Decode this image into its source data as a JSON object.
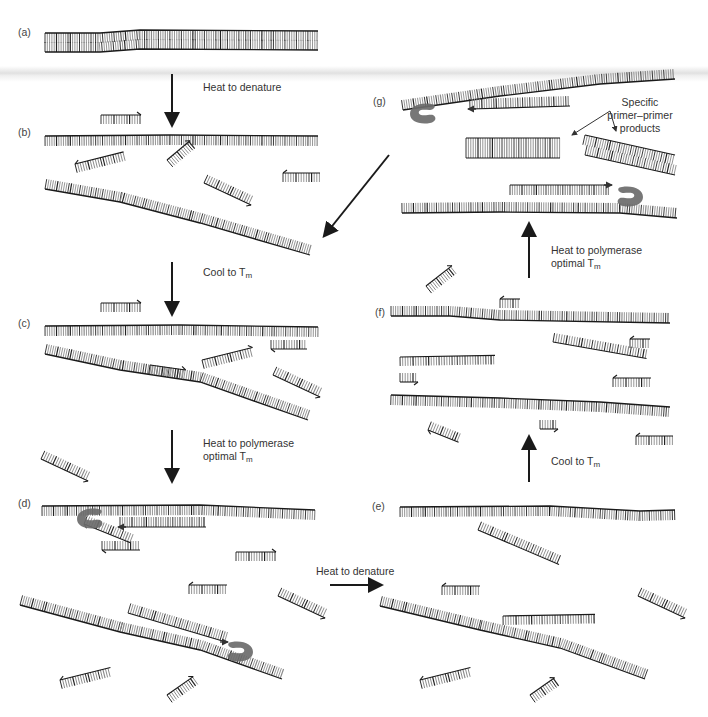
{
  "figure": {
    "colors": {
      "strand": "#1a1a1a",
      "tick_dark": "#222222",
      "tick_light": "#8a8a8a",
      "polymerase": "#6b6b6b",
      "text": "#333333",
      "background": "#ffffff"
    }
  },
  "panels": [
    {
      "id": "a",
      "label": "(a)",
      "x": 18,
      "y": 26
    },
    {
      "id": "b",
      "label": "(b)",
      "x": 18,
      "y": 126
    },
    {
      "id": "c",
      "label": "(c)",
      "x": 18,
      "y": 317
    },
    {
      "id": "d",
      "label": "(d)",
      "x": 18,
      "y": 497
    },
    {
      "id": "e",
      "label": "(e)",
      "x": 372,
      "y": 500
    },
    {
      "id": "f",
      "label": "(f)",
      "x": 375,
      "y": 306
    },
    {
      "id": "g",
      "label": "(g)",
      "x": 373,
      "y": 95
    }
  ],
  "steps": [
    {
      "id": "a-to-b",
      "text": "Heat to denature",
      "sub": "",
      "x": 203,
      "y": 81
    },
    {
      "id": "b-to-c",
      "text": "Cool to T",
      "sub": "m",
      "x": 203,
      "y": 266
    },
    {
      "id": "c-to-d",
      "text": "Heat to polymerase",
      "text2": "optimal T",
      "sub": "m",
      "x": 203,
      "y": 437
    },
    {
      "id": "d-to-e",
      "text": "Heat to denature",
      "sub": "",
      "x": 316,
      "y": 565
    },
    {
      "id": "e-to-f",
      "text": "Cool to T",
      "sub": "m",
      "x": 551,
      "y": 455
    },
    {
      "id": "f-to-g",
      "text": "Heat to polymerase",
      "text2": "optimal T",
      "sub": "m",
      "x": 551,
      "y": 244
    }
  ],
  "annotations": [
    {
      "id": "specific-products",
      "lines": [
        "Specific",
        "primer–primer",
        "products"
      ],
      "x": 628,
      "y": 96
    }
  ],
  "arrows": [
    {
      "id": "arrow-a-b",
      "x1": 172,
      "y1": 74,
      "x2": 172,
      "y2": 124,
      "dir": "down"
    },
    {
      "id": "arrow-b-c",
      "x1": 172,
      "y1": 262,
      "x2": 172,
      "y2": 313,
      "dir": "down"
    },
    {
      "id": "arrow-c-d",
      "x1": 172,
      "y1": 430,
      "x2": 172,
      "y2": 480,
      "dir": "down"
    },
    {
      "id": "arrow-d-e",
      "x1": 330,
      "y1": 585,
      "x2": 380,
      "y2": 585,
      "dir": "right"
    },
    {
      "id": "arrow-e-f",
      "x1": 529,
      "y1": 482,
      "x2": 529,
      "y2": 438,
      "dir": "up"
    },
    {
      "id": "arrow-f-g",
      "x1": 529,
      "y1": 278,
      "x2": 529,
      "y2": 225,
      "dir": "up"
    },
    {
      "id": "arrow-g-b",
      "x1": 389,
      "y1": 155,
      "x2": 325,
      "y2": 235,
      "dir": "diag"
    },
    {
      "id": "arrow-specific-1",
      "x1": 610,
      "y1": 111,
      "x2": 572,
      "y2": 135,
      "dir": "thin"
    },
    {
      "id": "arrow-specific-2",
      "x1": 610,
      "y1": 111,
      "x2": 616,
      "y2": 131,
      "dir": "thin"
    }
  ],
  "strands": [
    {
      "panel": "a",
      "pts": [
        [
          45,
          33
        ],
        [
          100,
          33
        ],
        [
          140,
          30
        ],
        [
          318,
          31
        ]
      ],
      "side": "down",
      "len": 10,
      "double": true
    },
    {
      "panel": "a",
      "pts": [
        [
          45,
          52
        ],
        [
          100,
          52
        ],
        [
          140,
          49
        ],
        [
          318,
          50
        ]
      ],
      "side": "up",
      "len": 10
    },
    {
      "panel": "b",
      "pts": [
        [
          45,
          136
        ],
        [
          170,
          135
        ],
        [
          318,
          136
        ]
      ],
      "side": "down",
      "len": 10
    },
    {
      "panel": "b",
      "pts": [
        [
          45,
          189
        ],
        [
          120,
          202
        ],
        [
          200,
          223
        ],
        [
          310,
          255
        ]
      ],
      "side": "up",
      "len": 10
    },
    {
      "panel": "c",
      "pts": [
        [
          45,
          326
        ],
        [
          180,
          325
        ],
        [
          318,
          327
        ]
      ],
      "side": "down",
      "len": 10
    },
    {
      "panel": "c",
      "pts": [
        [
          45,
          354
        ],
        [
          120,
          370
        ],
        [
          200,
          382
        ],
        [
          308,
          420
        ]
      ],
      "side": "up",
      "len": 10
    },
    {
      "panel": "d",
      "pts": [
        [
          42,
          506
        ],
        [
          200,
          505
        ],
        [
          315,
          510
        ]
      ],
      "side": "down",
      "len": 10
    },
    {
      "panel": "d",
      "pts": [
        [
          20,
          605
        ],
        [
          120,
          632
        ],
        [
          200,
          650
        ],
        [
          282,
          679
        ]
      ],
      "side": "up",
      "len": 10
    },
    {
      "panel": "e",
      "pts": [
        [
          400,
          507
        ],
        [
          550,
          506
        ],
        [
          640,
          511
        ],
        [
          675,
          510
        ]
      ],
      "side": "down",
      "len": 10
    },
    {
      "panel": "e",
      "pts": [
        [
          380,
          606
        ],
        [
          480,
          630
        ],
        [
          560,
          648
        ],
        [
          645,
          679
        ]
      ],
      "side": "up",
      "len": 10
    },
    {
      "panel": "f",
      "pts": [
        [
          391,
          316
        ],
        [
          450,
          316
        ],
        [
          500,
          320
        ],
        [
          670,
          323
        ]
      ],
      "side": "up",
      "len": 10
    },
    {
      "panel": "f",
      "pts": [
        [
          391,
          395
        ],
        [
          500,
          398
        ],
        [
          600,
          402
        ],
        [
          670,
          407
        ]
      ],
      "side": "down",
      "len": 10
    },
    {
      "panel": "g",
      "pts": [
        [
          403,
          110
        ],
        [
          500,
          96
        ],
        [
          600,
          84
        ],
        [
          675,
          79
        ]
      ],
      "side": "up",
      "len": 10
    },
    {
      "panel": "g",
      "pts": [
        [
          402,
          213
        ],
        [
          500,
          212
        ],
        [
          620,
          213
        ],
        [
          677,
          218
        ]
      ],
      "side": "up",
      "len": 10
    }
  ],
  "primers": [
    {
      "panel": "b",
      "x": 101,
      "y": 115,
      "w": 40,
      "angle": 0,
      "side": "down",
      "head": "right"
    },
    {
      "panel": "b",
      "x": 75,
      "y": 164,
      "w": 50,
      "angle": -14,
      "side": "down",
      "head": "left"
    },
    {
      "panel": "b",
      "x": 167,
      "y": 160,
      "w": 30,
      "angle": -40,
      "side": "down",
      "head": "right"
    },
    {
      "panel": "b",
      "x": 204,
      "y": 183,
      "w": 52,
      "angle": 25,
      "side": "up",
      "head": "right"
    },
    {
      "panel": "b",
      "x": 283,
      "y": 173,
      "w": 37,
      "angle": 0,
      "side": "down",
      "head": "left"
    },
    {
      "panel": "c",
      "x": 101,
      "y": 303,
      "w": 40,
      "angle": 0,
      "side": "down",
      "head": "right"
    },
    {
      "panel": "c",
      "x": 271,
      "y": 349,
      "w": 36,
      "angle": 0,
      "side": "up",
      "head": "left"
    },
    {
      "panel": "c",
      "x": 202,
      "y": 360,
      "w": 52,
      "angle": -14,
      "side": "down",
      "head": "right"
    },
    {
      "panel": "c",
      "x": 150,
      "y": 365,
      "w": 36,
      "angle": 8,
      "side": "down",
      "head": "right"
    },
    {
      "panel": "c",
      "x": 273,
      "y": 375,
      "w": 52,
      "angle": 25,
      "side": "up",
      "head": "right"
    },
    {
      "panel": "c",
      "x": 41,
      "y": 459,
      "w": 52,
      "angle": 25,
      "side": "up",
      "head": "right"
    },
    {
      "panel": "d",
      "x": 102,
      "y": 550,
      "w": 38,
      "angle": 0,
      "side": "up",
      "head": "left"
    },
    {
      "panel": "d",
      "x": 84,
      "y": 524,
      "w": 50,
      "angle": 22,
      "side": "up",
      "head": "left"
    },
    {
      "panel": "d",
      "x": 236,
      "y": 552,
      "w": 40,
      "angle": 0,
      "side": "down",
      "head": "right"
    },
    {
      "panel": "d",
      "x": 189,
      "y": 585,
      "w": 38,
      "angle": 0,
      "side": "down",
      "head": "left"
    },
    {
      "panel": "d",
      "x": 278,
      "y": 596,
      "w": 52,
      "angle": 25,
      "side": "up",
      "head": "right"
    },
    {
      "panel": "d",
      "x": 60,
      "y": 680,
      "w": 52,
      "angle": -14,
      "side": "down",
      "head": "left"
    },
    {
      "panel": "d",
      "x": 167,
      "y": 695,
      "w": 32,
      "angle": -35,
      "side": "down",
      "head": "right"
    },
    {
      "panel": "e",
      "x": 442,
      "y": 586,
      "w": 38,
      "angle": 0,
      "side": "down",
      "head": "left"
    },
    {
      "panel": "e",
      "x": 478,
      "y": 530,
      "w": 88,
      "angle": 23,
      "side": "up",
      "head": "none"
    },
    {
      "panel": "e",
      "x": 503,
      "y": 616,
      "w": 92,
      "angle": -1,
      "side": "down",
      "head": "none"
    },
    {
      "panel": "e",
      "x": 638,
      "y": 596,
      "w": 52,
      "angle": 25,
      "side": "up",
      "head": "right"
    },
    {
      "panel": "e",
      "x": 420,
      "y": 680,
      "w": 52,
      "angle": -14,
      "side": "down",
      "head": "left"
    },
    {
      "panel": "e",
      "x": 530,
      "y": 695,
      "w": 30,
      "angle": -35,
      "side": "down",
      "head": "right"
    },
    {
      "panel": "f",
      "x": 426,
      "y": 286,
      "w": 33,
      "angle": -38,
      "side": "down",
      "head": "right"
    },
    {
      "panel": "f",
      "x": 500,
      "y": 299,
      "w": 20,
      "angle": 0,
      "side": "down",
      "head": "left"
    },
    {
      "panel": "f",
      "x": 400,
      "y": 357,
      "w": 95,
      "angle": -1,
      "side": "down",
      "head": "none"
    },
    {
      "panel": "f",
      "x": 553,
      "y": 342,
      "w": 95,
      "angle": 10,
      "side": "up",
      "head": "none"
    },
    {
      "panel": "f",
      "x": 630,
      "y": 339,
      "w": 20,
      "angle": 0,
      "side": "down",
      "head": "left"
    },
    {
      "panel": "f",
      "x": 613,
      "y": 378,
      "w": 38,
      "angle": 0,
      "side": "down",
      "head": "left"
    },
    {
      "panel": "f",
      "x": 428,
      "y": 430,
      "w": 33,
      "angle": 22,
      "side": "up",
      "head": "left"
    },
    {
      "panel": "f",
      "x": 540,
      "y": 429,
      "w": 18,
      "angle": 0,
      "side": "up",
      "head": "right"
    },
    {
      "panel": "f",
      "x": 636,
      "y": 436,
      "w": 37,
      "angle": 0,
      "side": "down",
      "head": "left"
    },
    {
      "panel": "f",
      "x": 400,
      "y": 382,
      "w": 18,
      "angle": 0,
      "side": "up",
      "head": "right"
    }
  ],
  "duplex_extensions": [
    {
      "panel": "d",
      "x1": 120,
      "y1": 527,
      "x2": 206,
      "y2": 527,
      "side": "up",
      "head": "left-at-start"
    },
    {
      "panel": "d",
      "x1": 128,
      "y1": 613,
      "x2": 226,
      "y2": 642,
      "side": "up",
      "head": "right-at-end"
    },
    {
      "panel": "g",
      "x1": 470,
      "y1": 109,
      "x2": 570,
      "y2": 106,
      "side": "up",
      "head": "left-at-start"
    },
    {
      "panel": "g",
      "x1": 510,
      "y1": 185,
      "x2": 610,
      "y2": 185,
      "side": "down",
      "head": "right-at-end"
    },
    {
      "panel": "g",
      "x1": 466,
      "y1": 138,
      "x2": 560,
      "y2": 138,
      "side": "down",
      "head": "none",
      "double": true
    },
    {
      "panel": "g",
      "x1": 585,
      "y1": 135,
      "x2": 675,
      "y2": 155,
      "side": "down",
      "head": "none",
      "double": true
    }
  ],
  "polymerases": [
    {
      "panel": "d",
      "x": 90,
      "y": 518,
      "facing": "right"
    },
    {
      "panel": "d",
      "x": 240,
      "y": 651,
      "facing": "left"
    },
    {
      "panel": "g",
      "x": 423,
      "y": 113,
      "facing": "right"
    },
    {
      "panel": "g",
      "x": 630,
      "y": 196,
      "facing": "left"
    }
  ]
}
